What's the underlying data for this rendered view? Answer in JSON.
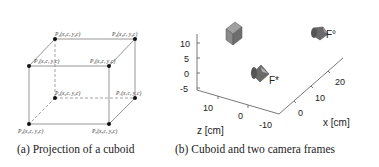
{
  "panel_a": {
    "caption": "(a) Projection of a cuboid",
    "points": [
      {
        "id": "P1",
        "label": "P₁(x₁c, y₁c)"
      },
      {
        "id": "P2",
        "label": "P₂(x₂c, y₂c)"
      },
      {
        "id": "P3",
        "label": "P₃(x₃c, y₃c)"
      },
      {
        "id": "P4",
        "label": "P₄(x₄c, y₄c)"
      },
      {
        "id": "P5",
        "label": "P₅(x₅c, y₅c)"
      },
      {
        "id": "P6",
        "label": "P₆(x₆c, y₆c)"
      },
      {
        "id": "P7",
        "label": "P₇(x₇c, y₇c)"
      },
      {
        "id": "P8",
        "label": "P₈(x₈c, y₈c)"
      }
    ]
  },
  "panel_b": {
    "caption": "(b) Cuboid and two camera frames",
    "y_axis": {
      "label": "y [cm]",
      "ticks": [
        "10",
        "5",
        "0",
        "-5"
      ]
    },
    "z_axis": {
      "label": "z [cm]",
      "ticks": [
        "10",
        "0",
        "-10"
      ]
    },
    "x_axis": {
      "label": "x [cm]",
      "ticks": [
        "0",
        "10",
        "20"
      ]
    },
    "frames": [
      {
        "id": "F-star",
        "label": "F*"
      },
      {
        "id": "F-circle",
        "label": "F°"
      }
    ],
    "colors": {
      "object": "#7a7a7a",
      "axis": "#555555"
    }
  }
}
